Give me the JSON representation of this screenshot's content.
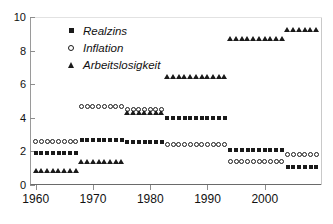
{
  "chart_data": {
    "type": "scatter",
    "title": "",
    "xlabel": "",
    "ylabel": "",
    "xlim": [
      1959,
      2010
    ],
    "ylim": [
      0,
      10
    ],
    "xticks": [
      "1960",
      "1970",
      "1980",
      "1990",
      "2000"
    ],
    "xtick_values": [
      1960,
      1970,
      1980,
      1990,
      2000
    ],
    "yticks": [
      "0",
      "2",
      "4",
      "6",
      "8",
      "10"
    ],
    "ytick_values": [
      0,
      2,
      4,
      6,
      8,
      10
    ],
    "grid": false,
    "legend_position": "top-left",
    "x": [
      1960,
      1961,
      1962,
      1963,
      1964,
      1965,
      1966,
      1967,
      1968,
      1969,
      1970,
      1971,
      1972,
      1973,
      1974,
      1975,
      1976,
      1977,
      1978,
      1979,
      1980,
      1981,
      1982,
      1983,
      1984,
      1985,
      1986,
      1987,
      1988,
      1989,
      1990,
      1991,
      1992,
      1993,
      1994,
      1995,
      1996,
      1997,
      1998,
      1999,
      2000,
      2001,
      2002,
      2003,
      2004,
      2005,
      2006,
      2007,
      2008,
      2009
    ],
    "series": [
      {
        "name": "Realzins",
        "marker": "square",
        "color": "#1a1a1a",
        "values": [
          1.9,
          1.9,
          1.9,
          1.9,
          1.9,
          1.9,
          1.9,
          1.9,
          2.65,
          2.65,
          2.65,
          2.65,
          2.65,
          2.65,
          2.65,
          2.65,
          2.55,
          2.55,
          2.55,
          2.55,
          2.55,
          2.55,
          2.55,
          4.0,
          4.0,
          4.0,
          4.0,
          4.0,
          4.0,
          4.0,
          4.0,
          4.0,
          4.0,
          4.0,
          2.1,
          2.1,
          2.1,
          2.1,
          2.1,
          2.1,
          2.1,
          2.1,
          2.1,
          2.1,
          1.1,
          1.1,
          1.1,
          1.1,
          1.1,
          1.1
        ]
      },
      {
        "name": "Inflation",
        "marker": "circle",
        "color": "#1a1a1a",
        "values": [
          2.6,
          2.6,
          2.6,
          2.6,
          2.6,
          2.6,
          2.6,
          2.6,
          4.7,
          4.7,
          4.7,
          4.7,
          4.7,
          4.7,
          4.7,
          4.7,
          4.5,
          4.5,
          4.5,
          4.5,
          4.5,
          4.5,
          4.5,
          2.4,
          2.4,
          2.4,
          2.4,
          2.4,
          2.4,
          2.4,
          2.4,
          2.4,
          2.4,
          2.4,
          1.4,
          1.4,
          1.4,
          1.4,
          1.4,
          1.4,
          1.4,
          1.4,
          1.4,
          1.4,
          1.8,
          1.8,
          1.8,
          1.8,
          1.8,
          1.8
        ]
      },
      {
        "name": "Arbeitslosigkeit",
        "marker": "triangle",
        "color": "#1a1a1a",
        "values": [
          0.8,
          0.8,
          0.8,
          0.8,
          0.8,
          0.8,
          0.8,
          0.8,
          1.35,
          1.35,
          1.35,
          1.35,
          1.35,
          1.35,
          1.35,
          1.35,
          4.25,
          4.25,
          4.25,
          4.25,
          4.25,
          4.25,
          4.25,
          6.4,
          6.4,
          6.4,
          6.4,
          6.4,
          6.4,
          6.4,
          6.4,
          6.4,
          6.4,
          6.4,
          8.7,
          8.7,
          8.7,
          8.7,
          8.7,
          8.7,
          8.7,
          8.7,
          8.7,
          8.7,
          9.2,
          9.2,
          9.2,
          9.2,
          9.2,
          9.2
        ]
      }
    ]
  },
  "legend": {
    "items": [
      {
        "label": "Realzins",
        "marker": "square"
      },
      {
        "label": "Inflation",
        "marker": "circle"
      },
      {
        "label": "Arbeitslosigkeit",
        "marker": "triangle"
      }
    ]
  }
}
